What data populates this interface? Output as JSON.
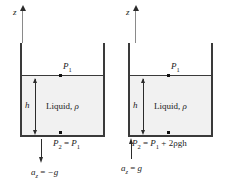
{
  "figure": {
    "colors": {
      "liquid_fill": "#f1f1f1",
      "tank_outline": "#3a3a3a",
      "axis_gray": "#8a8a8a",
      "ink": "#1a1a1a",
      "background": "#ffffff"
    }
  },
  "panels": [
    {
      "id": "free-fall",
      "axis_label": "z",
      "liquid_label_text": "Liquid, ",
      "liquid_label_rho": "ρ",
      "depth_label": "h",
      "surface_point_label": "P",
      "surface_point_sub": "1",
      "pressure_equation": {
        "lhs": "P",
        "lhs_sub": "2",
        "operator": "=",
        "rhs": "P",
        "rhs_sub": "1",
        "extra": ""
      },
      "acceleration": {
        "symbol": "a",
        "sub": "z",
        "operator": "=",
        "value": "−g",
        "direction": "down"
      }
    },
    {
      "id": "upward-acceleration",
      "axis_label": "z",
      "liquid_label_text": "Liquid, ",
      "liquid_label_rho": "ρ",
      "depth_label": "h",
      "surface_point_label": "P",
      "surface_point_sub": "1",
      "pressure_equation": {
        "lhs": "P",
        "lhs_sub": "2",
        "operator": "=",
        "rhs": "P",
        "rhs_sub": "1",
        "extra": " + 2ρgh"
      },
      "acceleration": {
        "symbol": "a",
        "sub": "z",
        "operator": "=",
        "value": "g",
        "direction": "up"
      }
    }
  ]
}
